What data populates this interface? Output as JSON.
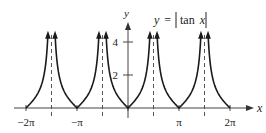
{
  "chart_data": {
    "type": "line",
    "title_parts": {
      "lhs": "y",
      "eq": "=",
      "fn": "tan",
      "var": "x"
    },
    "xlabel": "x",
    "ylabel": "y",
    "xlim": [
      -7.2,
      7.6
    ],
    "ylim": [
      -0.5,
      5.2
    ],
    "x_ticks": [
      {
        "value": -6.2832,
        "label": "−2π"
      },
      {
        "value": -3.1416,
        "label": "−π"
      },
      {
        "value": 0,
        "label": ""
      },
      {
        "value": 3.1416,
        "label": "π"
      },
      {
        "value": 6.2832,
        "label": "2π"
      }
    ],
    "y_ticks": [
      {
        "value": 2,
        "label": "2"
      },
      {
        "value": 4,
        "label": "4"
      }
    ],
    "asymptotes": [
      -4.7124,
      -1.5708,
      1.5708,
      4.7124
    ],
    "asymptote_style": "dashed",
    "series": [
      {
        "name": "|tan x|",
        "function": "abs_tan",
        "domain": [
          -6.2832,
          6.2832
        ],
        "y_max": 4.5
      }
    ],
    "grid": false,
    "legend": "none",
    "colors": {
      "curve": "#1a1a1a",
      "axis": "#444444",
      "asymptote": "#555555"
    }
  }
}
